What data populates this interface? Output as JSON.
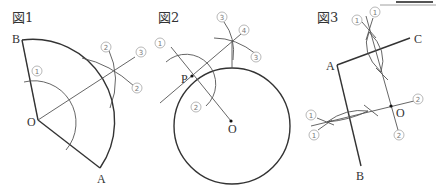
{
  "figures": [
    {
      "title": "図1",
      "points": {
        "O": "O",
        "A": "A",
        "B": "B"
      },
      "step_labels": {
        "s1": "1",
        "s2a": "2",
        "s2b": "2",
        "s3": "3"
      }
    },
    {
      "title": "図2",
      "points": {
        "P": "P",
        "O": "O"
      },
      "step_labels": {
        "s1": "1",
        "s2": "2",
        "s3a": "3",
        "s3b": "3",
        "s4": "4"
      }
    },
    {
      "title": "図3",
      "points": {
        "A": "A",
        "B": "B",
        "C": "C",
        "O": "O"
      },
      "step_labels": {
        "s1a": "1",
        "s1b": "1",
        "s1c": "1",
        "s1d": "1",
        "s2a": "2",
        "s2b": "2"
      }
    }
  ],
  "colors": {
    "line": "#333333",
    "aux_line": "#555555",
    "label_ring": "#999999"
  }
}
